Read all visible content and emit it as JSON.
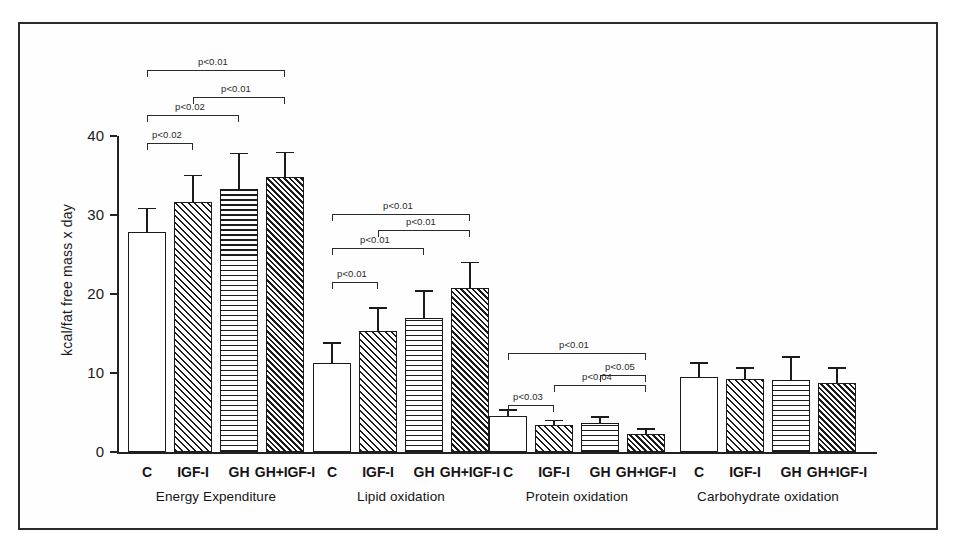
{
  "figure": {
    "frame": true,
    "background": "#ffffff",
    "ink_color": "#1b1b1b"
  },
  "chart_data": {
    "type": "bar",
    "title": "",
    "subtitle": "",
    "xlabel": "",
    "ylabel": "kcal/fat free mass x day",
    "ylim": [
      0,
      40
    ],
    "yticks": [
      0,
      10,
      20,
      30,
      40
    ],
    "ytick_labels": [
      "0",
      "10",
      "20",
      "30",
      "40"
    ],
    "grid": false,
    "legend": "none",
    "error_bars": "SD",
    "categories": [
      "C",
      "IGF-I",
      "GH",
      "GH+IGF-I"
    ],
    "group_labels": [
      "Energy Expenditure",
      "Lipid oxidation",
      "Protein oxidation",
      "Carbohydrate oxidation"
    ],
    "bar_patterns": [
      "open",
      "diagonal-hatch",
      "horizontal-lines",
      "diagonal-hatch-dense"
    ],
    "groups": [
      {
        "name": "Energy Expenditure",
        "values": [
          27.8,
          31.7,
          33.3,
          34.8
        ],
        "errors": [
          3.1,
          3.4,
          4.6,
          3.2
        ],
        "significance": [
          {
            "from": 0,
            "to": 1,
            "label": "p<0.02"
          },
          {
            "from": 0,
            "to": 2,
            "label": "p<0.02"
          },
          {
            "from": 1,
            "to": 3,
            "label": "p<0.01"
          },
          {
            "from": 0,
            "to": 3,
            "label": "p<0.01"
          }
        ]
      },
      {
        "name": "Lipid oxidation",
        "values": [
          11.3,
          15.3,
          16.9,
          20.8
        ],
        "errors": [
          2.6,
          3.0,
          3.6,
          3.3
        ],
        "significance": [
          {
            "from": 0,
            "to": 1,
            "label": "p<0.01"
          },
          {
            "from": 0,
            "to": 2,
            "label": "p<0.01"
          },
          {
            "from": 1,
            "to": 3,
            "label": "p<0.01"
          },
          {
            "from": 0,
            "to": 3,
            "label": "p<0.01"
          }
        ]
      },
      {
        "name": "Protein oxidation",
        "values": [
          4.6,
          3.4,
          3.7,
          2.3
        ],
        "errors": [
          0.8,
          0.7,
          0.8,
          0.7
        ],
        "significance": [
          {
            "from": 0,
            "to": 1,
            "label": "p<0.03"
          },
          {
            "from": 1,
            "to": 3,
            "label": "p<0.04"
          },
          {
            "from": 2,
            "to": 3,
            "label": "p<0.05"
          },
          {
            "from": 0,
            "to": 3,
            "label": "p<0.01"
          }
        ]
      },
      {
        "name": "Carbohydrate oxidation",
        "values": [
          9.5,
          9.3,
          9.1,
          8.7
        ],
        "errors": [
          1.9,
          1.4,
          3.0,
          2.0
        ],
        "significance": []
      }
    ]
  }
}
